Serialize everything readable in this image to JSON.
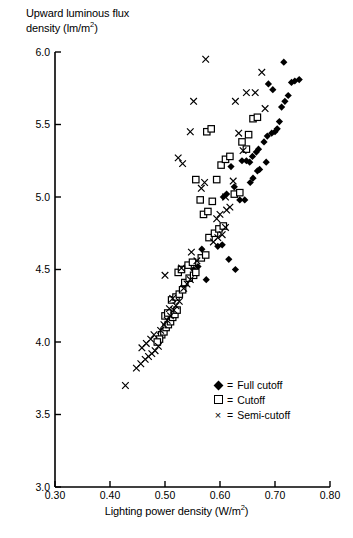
{
  "chart_data": {
    "type": "scatter",
    "title": "",
    "xlabel": "Lighting power density (W/m2)",
    "ylabel": "Upward luminous flux density (lm/m2)",
    "xlim": [
      0.3,
      0.8
    ],
    "ylim": [
      3.0,
      6.0
    ],
    "xticks": [
      "0.30",
      "0.40",
      "0.50",
      "0.60",
      "0.70",
      "0.80"
    ],
    "yticks": [
      "3.0",
      "3.5",
      "4.0",
      "4.5",
      "5.0",
      "5.5",
      "6.0"
    ],
    "grid": false,
    "legend_position": "bottom-right",
    "series": [
      {
        "name": "Full cutoff",
        "marker": "filled-diamond",
        "points": [
          [
            0.616,
            4.57
          ],
          [
            0.628,
            4.5
          ],
          [
            0.636,
            4.98
          ],
          [
            0.645,
            4.98
          ],
          [
            0.567,
            4.64
          ],
          [
            0.575,
            4.43
          ],
          [
            0.596,
            4.66
          ],
          [
            0.604,
            4.67
          ],
          [
            0.655,
            5.1
          ],
          [
            0.66,
            5.13
          ],
          [
            0.668,
            5.18
          ],
          [
            0.672,
            5.19
          ],
          [
            0.606,
            5.0
          ],
          [
            0.612,
            5.02
          ],
          [
            0.62,
            5.21
          ],
          [
            0.626,
            5.07
          ],
          [
            0.654,
            5.24
          ],
          [
            0.659,
            5.28
          ],
          [
            0.666,
            5.31
          ],
          [
            0.67,
            5.33
          ],
          [
            0.68,
            5.38
          ],
          [
            0.686,
            5.42
          ],
          [
            0.694,
            5.44
          ],
          [
            0.7,
            5.45
          ],
          [
            0.708,
            5.52
          ],
          [
            0.712,
            5.62
          ],
          [
            0.718,
            5.66
          ],
          [
            0.724,
            5.7
          ],
          [
            0.73,
            5.79
          ],
          [
            0.716,
            5.93
          ],
          [
            0.736,
            5.8
          ],
          [
            0.744,
            5.81
          ],
          [
            0.688,
            5.78
          ],
          [
            0.696,
            5.74
          ],
          [
            0.704,
            5.47
          ],
          [
            0.684,
            5.24
          ],
          [
            0.648,
            5.25
          ],
          [
            0.64,
            5.25
          ],
          [
            0.552,
            4.5
          ],
          [
            0.56,
            4.52
          ]
        ]
      },
      {
        "name": "Cutoff",
        "marker": "open-square",
        "points": [
          [
            0.494,
            4.05
          ],
          [
            0.498,
            4.07
          ],
          [
            0.502,
            4.1
          ],
          [
            0.506,
            4.12
          ],
          [
            0.51,
            4.14
          ],
          [
            0.514,
            4.17
          ],
          [
            0.518,
            4.19
          ],
          [
            0.522,
            4.22
          ],
          [
            0.49,
            4.02
          ],
          [
            0.486,
            4.0
          ],
          [
            0.5,
            4.18
          ],
          [
            0.505,
            4.2
          ],
          [
            0.512,
            4.29
          ],
          [
            0.52,
            4.31
          ],
          [
            0.526,
            4.33
          ],
          [
            0.532,
            4.36
          ],
          [
            0.536,
            4.41
          ],
          [
            0.544,
            4.44
          ],
          [
            0.552,
            4.46
          ],
          [
            0.556,
            4.48
          ],
          [
            0.542,
            4.53
          ],
          [
            0.55,
            4.55
          ],
          [
            0.566,
            4.58
          ],
          [
            0.574,
            4.6
          ],
          [
            0.58,
            4.72
          ],
          [
            0.59,
            4.75
          ],
          [
            0.598,
            4.78
          ],
          [
            0.606,
            4.8
          ],
          [
            0.57,
            4.88
          ],
          [
            0.578,
            4.9
          ],
          [
            0.564,
            4.98
          ],
          [
            0.586,
            4.97
          ],
          [
            0.556,
            5.12
          ],
          [
            0.594,
            5.12
          ],
          [
            0.626,
            5.02
          ],
          [
            0.636,
            5.03
          ],
          [
            0.602,
            5.22
          ],
          [
            0.61,
            5.26
          ],
          [
            0.618,
            5.28
          ],
          [
            0.648,
            5.33
          ],
          [
            0.576,
            5.45
          ],
          [
            0.584,
            5.47
          ],
          [
            0.64,
            5.38
          ],
          [
            0.652,
            5.43
          ],
          [
            0.66,
            5.54
          ],
          [
            0.668,
            5.55
          ],
          [
            0.524,
            4.48
          ],
          [
            0.53,
            4.5
          ]
        ]
      },
      {
        "name": "Semi-cutoff",
        "marker": "cross",
        "points": [
          [
            0.428,
            3.7
          ],
          [
            0.448,
            3.82
          ],
          [
            0.456,
            3.85
          ],
          [
            0.464,
            3.88
          ],
          [
            0.47,
            3.9
          ],
          [
            0.476,
            3.92
          ],
          [
            0.482,
            3.94
          ],
          [
            0.488,
            3.97
          ],
          [
            0.458,
            3.96
          ],
          [
            0.466,
            3.99
          ],
          [
            0.474,
            4.02
          ],
          [
            0.48,
            4.05
          ],
          [
            0.492,
            4.08
          ],
          [
            0.498,
            4.12
          ],
          [
            0.504,
            4.15
          ],
          [
            0.51,
            4.18
          ],
          [
            0.516,
            4.22
          ],
          [
            0.52,
            4.25
          ],
          [
            0.526,
            4.28
          ],
          [
            0.508,
            4.23
          ],
          [
            0.514,
            4.3
          ],
          [
            0.534,
            4.37
          ],
          [
            0.54,
            4.4
          ],
          [
            0.546,
            4.43
          ],
          [
            0.5,
            4.46
          ],
          [
            0.53,
            4.51
          ],
          [
            0.558,
            4.56
          ],
          [
            0.548,
            4.62
          ],
          [
            0.588,
            4.69
          ],
          [
            0.596,
            4.72
          ],
          [
            0.604,
            4.74
          ],
          [
            0.61,
            4.79
          ],
          [
            0.594,
            4.85
          ],
          [
            0.6,
            4.88
          ],
          [
            0.612,
            4.91
          ],
          [
            0.618,
            4.93
          ],
          [
            0.61,
            5.0
          ],
          [
            0.572,
            5.1
          ],
          [
            0.566,
            5.06
          ],
          [
            0.624,
            5.11
          ],
          [
            0.532,
            5.23
          ],
          [
            0.524,
            5.27
          ],
          [
            0.546,
            5.45
          ],
          [
            0.552,
            5.66
          ],
          [
            0.574,
            5.95
          ],
          [
            0.648,
            5.72
          ],
          [
            0.664,
            5.72
          ],
          [
            0.682,
            5.61
          ],
          [
            0.676,
            5.86
          ],
          [
            0.634,
            5.44
          ],
          [
            0.628,
            5.66
          ],
          [
            0.642,
            5.32
          ]
        ]
      }
    ]
  },
  "axes": {
    "x_title_pre": "Lighting power density (W/m",
    "x_title_sup": "2",
    "x_title_post": ")",
    "y_title_line1": "Upward luminous flux",
    "y_title_line2_pre": "density (lm/m",
    "y_title_sup": "2",
    "y_title_post": ")"
  },
  "legend": {
    "items": [
      {
        "marker": "filled-diamond",
        "equals": "=",
        "label": "Full cutoff"
      },
      {
        "marker": "open-square",
        "equals": "=",
        "label": "Cutoff"
      },
      {
        "marker": "cross",
        "equals": "=",
        "label": "Semi-cutoff"
      }
    ]
  }
}
